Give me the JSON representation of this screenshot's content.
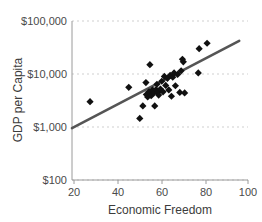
{
  "chart_data": {
    "type": "scatter",
    "title": "",
    "xlabel": "Economic Freedom",
    "ylabel": "GDP per Capita",
    "xlim": [
      20,
      100
    ],
    "ylim": [
      100,
      100000
    ],
    "yscale": "log",
    "xscale": "linear",
    "grid": "horizontal-dashed",
    "legend": "none",
    "xticks": [
      20,
      40,
      60,
      80,
      100
    ],
    "xtick_labels": [
      "20",
      "40",
      "60",
      "80",
      "100"
    ],
    "yticks": [
      100,
      1000,
      10000,
      100000
    ],
    "ytick_labels": [
      "$100",
      "$1,000",
      "$10,000",
      "$100,000"
    ],
    "marker": "diamond",
    "marker_color": "#111111",
    "points": [
      {
        "x": 28.2,
        "y": 3000
      },
      {
        "x": 45.8,
        "y": 5600
      },
      {
        "x": 50.8,
        "y": 1450
      },
      {
        "x": 52.2,
        "y": 2500
      },
      {
        "x": 53.6,
        "y": 6900
      },
      {
        "x": 53.8,
        "y": 4100
      },
      {
        "x": 54.4,
        "y": 3700
      },
      {
        "x": 55.0,
        "y": 4600
      },
      {
        "x": 55.4,
        "y": 15000
      },
      {
        "x": 56.0,
        "y": 3900
      },
      {
        "x": 56.6,
        "y": 5000
      },
      {
        "x": 57.2,
        "y": 4400
      },
      {
        "x": 57.6,
        "y": 2500
      },
      {
        "x": 58.2,
        "y": 5100
      },
      {
        "x": 58.6,
        "y": 6400
      },
      {
        "x": 59.0,
        "y": 4500
      },
      {
        "x": 59.4,
        "y": 4000
      },
      {
        "x": 60.2,
        "y": 5200
      },
      {
        "x": 60.8,
        "y": 7300
      },
      {
        "x": 61.4,
        "y": 4600
      },
      {
        "x": 62.0,
        "y": 9000
      },
      {
        "x": 62.6,
        "y": 6100
      },
      {
        "x": 63.4,
        "y": 8300
      },
      {
        "x": 64.0,
        "y": 5000
      },
      {
        "x": 64.6,
        "y": 9400
      },
      {
        "x": 65.2,
        "y": 3800
      },
      {
        "x": 65.8,
        "y": 8700
      },
      {
        "x": 66.4,
        "y": 10500
      },
      {
        "x": 67.0,
        "y": 6000
      },
      {
        "x": 68.0,
        "y": 9800
      },
      {
        "x": 69.0,
        "y": 4500
      },
      {
        "x": 69.6,
        "y": 11500
      },
      {
        "x": 70.2,
        "y": 19000
      },
      {
        "x": 70.6,
        "y": 17000
      },
      {
        "x": 71.2,
        "y": 4400
      },
      {
        "x": 77.4,
        "y": 10500
      },
      {
        "x": 77.8,
        "y": 30000
      },
      {
        "x": 81.4,
        "y": 38000
      }
    ],
    "trend_line": {
      "label": "fit-line",
      "color": "#555555",
      "x_start": 20,
      "y_start": 950,
      "x_end": 96,
      "y_end": 42000
    }
  }
}
